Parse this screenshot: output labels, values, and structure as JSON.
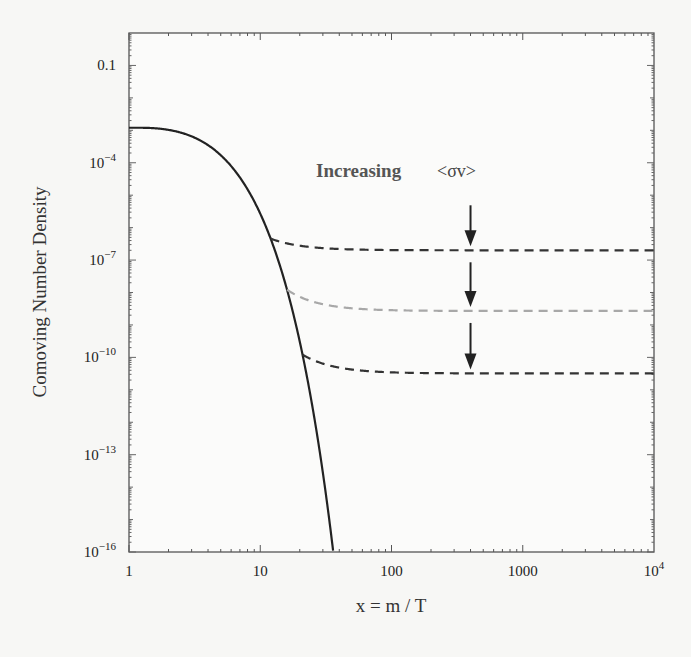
{
  "chart_data": {
    "type": "line",
    "title": "",
    "xlabel": "x = m / T",
    "ylabel": "Comoving Number Density",
    "xscale": "log",
    "yscale": "log",
    "xlim": [
      1,
      10000
    ],
    "ylim": [
      1e-16,
      1
    ],
    "x_ticks": [
      {
        "value": 1,
        "label": "1"
      },
      {
        "value": 10,
        "label": "10"
      },
      {
        "value": 100,
        "label": "100"
      },
      {
        "value": 1000,
        "label": "1000"
      },
      {
        "value": 10000,
        "label": "10",
        "sup": "4"
      }
    ],
    "y_ticks": [
      {
        "value": 0.1,
        "label": "0.1",
        "sup": ""
      },
      {
        "value": 0.0001,
        "label": "10",
        "sup": "−4"
      },
      {
        "value": 1e-07,
        "label": "10",
        "sup": "−7"
      },
      {
        "value": 1e-10,
        "label": "10",
        "sup": "−10"
      },
      {
        "value": 1e-13,
        "label": "10",
        "sup": "−13"
      },
      {
        "value": 1e-16,
        "label": "10",
        "sup": "−16"
      }
    ],
    "grid": false,
    "legend": "none",
    "equilibrium": {
      "name": "Equilibrium density",
      "style": "solid",
      "color": "#222222",
      "initial_value": 0.0012,
      "x_at_lower_bound": 36
    },
    "series": [
      {
        "name": "Freeze-out (smaller <σv>)",
        "style": "dashed",
        "color": "#333333",
        "freeze_out_x": 12,
        "relic_value": 2e-07
      },
      {
        "name": "Freeze-out (medium <σv>)",
        "style": "dashed",
        "color": "#a8a8a8",
        "freeze_out_x": 16,
        "relic_value": 2.7e-09
      },
      {
        "name": "Freeze-out (larger <σv>)",
        "style": "dashed",
        "color": "#333333",
        "freeze_out_x": 21,
        "relic_value": 3.2e-11
      }
    ],
    "annotations": [
      {
        "text": "Increasing",
        "position": "upper-right"
      },
      {
        "text": "<σv>",
        "position": "upper-right"
      }
    ],
    "arrows": [
      {
        "x": 400,
        "from_series": "above-top",
        "to_series": 0,
        "direction": "down"
      },
      {
        "x": 400,
        "from_series": 0,
        "to_series": 1,
        "direction": "down"
      },
      {
        "x": 400,
        "from_series": 1,
        "to_series": 2,
        "direction": "down"
      }
    ]
  }
}
